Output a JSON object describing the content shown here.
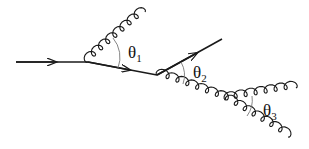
{
  "diagram": {
    "type": "feynman-diagram",
    "colors": {
      "line": "#1a1a1a",
      "arc": "#777777",
      "background": "#ffffff"
    },
    "lines": [
      {
        "id": "incoming-quark",
        "kind": "fermion",
        "from": [
          16,
          62
        ],
        "to": [
          88,
          62
        ],
        "arrow": true
      },
      {
        "id": "quark-after-emission-1",
        "kind": "fermion",
        "from": [
          88,
          62
        ],
        "to": [
          157,
          75
        ],
        "arrow": true
      },
      {
        "id": "gluon-1",
        "kind": "gluon",
        "from": [
          88,
          62
        ],
        "to": [
          145,
          12
        ]
      },
      {
        "id": "outgoing-quark",
        "kind": "fermion",
        "from": [
          157,
          75
        ],
        "to": [
          222,
          39
        ],
        "arrow": true
      },
      {
        "id": "gluon-2",
        "kind": "gluon",
        "from": [
          157,
          75
        ],
        "to": [
          226,
          100
        ]
      },
      {
        "id": "gluon-3a",
        "kind": "gluon",
        "from": [
          226,
          100
        ],
        "to": [
          296,
          88
        ]
      },
      {
        "id": "gluon-3b",
        "kind": "gluon",
        "from": [
          226,
          100
        ],
        "to": [
          288,
          137
        ]
      }
    ],
    "angles": [
      {
        "id": "theta1",
        "symbol": "θ",
        "subscript": "1",
        "position": [
          128,
          45
        ]
      },
      {
        "id": "theta2",
        "symbol": "θ",
        "subscript": "2",
        "position": [
          192,
          66
        ]
      },
      {
        "id": "theta3",
        "symbol": "θ",
        "subscript": "3",
        "position": [
          263,
          103
        ]
      }
    ]
  }
}
